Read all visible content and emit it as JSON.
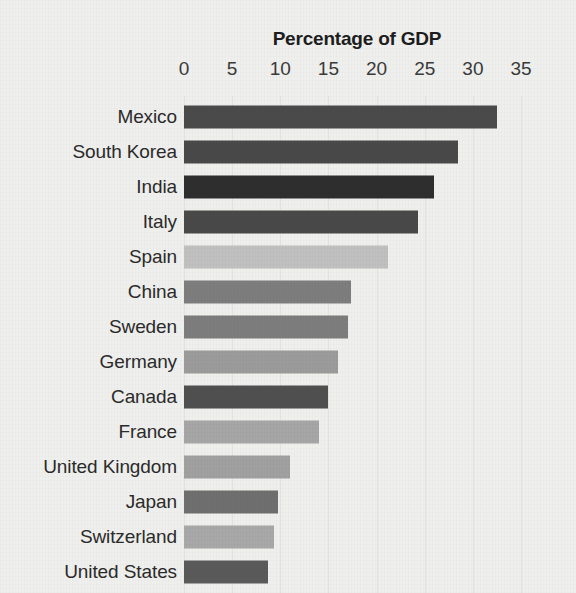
{
  "page": {
    "background_color": "#efefed",
    "top_bleed_text": "· · ·"
  },
  "chart_data": {
    "type": "bar",
    "orientation": "horizontal",
    "title": "Percentage of GDP",
    "xlabel": "",
    "ylabel": "",
    "xlim": [
      0,
      35
    ],
    "grid": true,
    "legend": "none",
    "tick_labels": [
      "0",
      "5",
      "10",
      "15",
      "20",
      "25",
      "30",
      "35"
    ],
    "ticks": [
      0,
      5,
      10,
      15,
      20,
      25,
      30,
      35
    ],
    "categories": [
      "Mexico",
      "South Korea",
      "India",
      "Italy",
      "Spain",
      "China",
      "Sweden",
      "Germany",
      "Canada",
      "France",
      "United Kingdom",
      "Japan",
      "Switzerland",
      "United States"
    ],
    "values": [
      32.5,
      28.5,
      26.0,
      24.3,
      21.2,
      17.3,
      17.0,
      16.0,
      15.0,
      14.0,
      11.0,
      9.8,
      9.3,
      8.7
    ],
    "bar_colors": [
      "#4a4a4a",
      "#494949",
      "#2e2e2e",
      "#494949",
      "#c0c0c0",
      "#7d7d7d",
      "#7d7d7d",
      "#9b9b9b",
      "#4f4f4f",
      "#a6a6a6",
      "#a0a0a0",
      "#6f6f6f",
      "#a8a8a8",
      "#5a5a5a"
    ],
    "gridline_color": "#e2e2e0",
    "axis_text_color": "#3a3a3a",
    "title_color": "#1d1d1d"
  }
}
